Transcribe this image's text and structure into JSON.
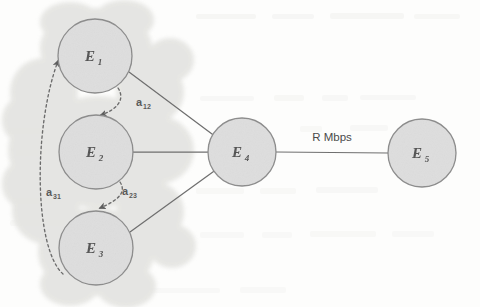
{
  "figure": {
    "type": "network-diagram",
    "caption": "",
    "background_color": "#fdfdfc",
    "cluster": {
      "name": "cloud-region",
      "fill_color": "#e3e3e0",
      "contains": [
        "E1",
        "E2",
        "E3"
      ]
    },
    "nodes": [
      {
        "id": "E1",
        "base": "E",
        "subscript": "1",
        "cx": 95,
        "cy": 56,
        "r": 37,
        "fill": "#dedede",
        "stroke": "#8a8a8a"
      },
      {
        "id": "E2",
        "base": "E",
        "subscript": "2",
        "cx": 96,
        "cy": 152,
        "r": 37,
        "fill": "#dedede",
        "stroke": "#8a8a8a"
      },
      {
        "id": "E3",
        "base": "E",
        "subscript": "3",
        "cx": 96,
        "cy": 248,
        "r": 37,
        "fill": "#dedede",
        "stroke": "#8a8a8a"
      },
      {
        "id": "E4",
        "base": "E",
        "subscript": "4",
        "cx": 242,
        "cy": 152,
        "r": 34,
        "fill": "#dedede",
        "stroke": "#8a8a8a"
      },
      {
        "id": "E5",
        "base": "E",
        "subscript": "5",
        "cx": 422,
        "cy": 153,
        "r": 34,
        "fill": "#dedede",
        "stroke": "#8a8a8a"
      }
    ],
    "dashed_edges": [
      {
        "id": "a12",
        "base": "a",
        "subscript": "12",
        "from": "E1",
        "to": "E2",
        "label_x": 140,
        "label_y": 103
      },
      {
        "id": "a23",
        "base": "a",
        "subscript": "23",
        "from": "E2",
        "to": "E3",
        "label_x": 125,
        "label_y": 192
      },
      {
        "id": "a31",
        "base": "a",
        "subscript": "31",
        "from": "E3",
        "to": "E1",
        "label_x": 50,
        "label_y": 193
      }
    ],
    "solid_edges": [
      {
        "id": "E1-E4",
        "from": "E1",
        "to": "E4",
        "label": ""
      },
      {
        "id": "E2-E4",
        "from": "E2",
        "to": "E4",
        "label": ""
      },
      {
        "id": "E3-E4",
        "from": "E3",
        "to": "E4",
        "label": ""
      },
      {
        "id": "E4-E5",
        "from": "E4",
        "to": "E5",
        "label": "R Mbps"
      }
    ],
    "link_label": {
      "text": "R Mbps",
      "x": 332,
      "y": 141
    },
    "colors": {
      "node_fill": "#dedede",
      "node_stroke": "#8a8a8a",
      "cloud_fill": "#e3e3e0",
      "edge_stroke": "#6f6f6f",
      "dashed_stroke": "#707070",
      "text": "#4d4d4d"
    }
  }
}
